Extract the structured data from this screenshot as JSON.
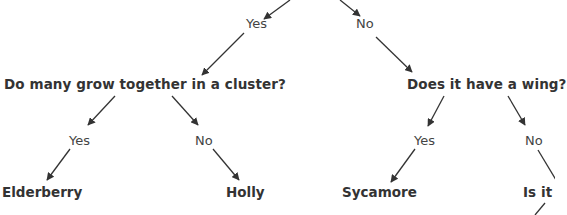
{
  "diagram": {
    "type": "decision-tree",
    "title": "",
    "nodes": {
      "q_cluster": "Do many grow together in a cluster?",
      "q_wing": "Does it have a wing?",
      "q_partial": "Is it",
      "leaf_elderberry": "Elderberry",
      "leaf_holly": "Holly",
      "leaf_sycamore": "Sycamore"
    },
    "edge_labels": {
      "root_yes": "Yes",
      "root_no": "No",
      "cluster_yes": "Yes",
      "cluster_no": "No",
      "wing_yes": "Yes",
      "wing_no": "No"
    },
    "edges": [
      {
        "from": "root",
        "to": "q_cluster",
        "label": "Yes"
      },
      {
        "from": "root",
        "to": "q_wing",
        "label": "No"
      },
      {
        "from": "q_cluster",
        "to": "leaf_elderberry",
        "label": "Yes"
      },
      {
        "from": "q_cluster",
        "to": "leaf_holly",
        "label": "No"
      },
      {
        "from": "q_wing",
        "to": "leaf_sycamore",
        "label": "Yes"
      },
      {
        "from": "q_wing",
        "to": "q_partial",
        "label": "No"
      }
    ],
    "colors": {
      "text": "#333333",
      "line": "#333333",
      "background": "#ffffff"
    }
  }
}
